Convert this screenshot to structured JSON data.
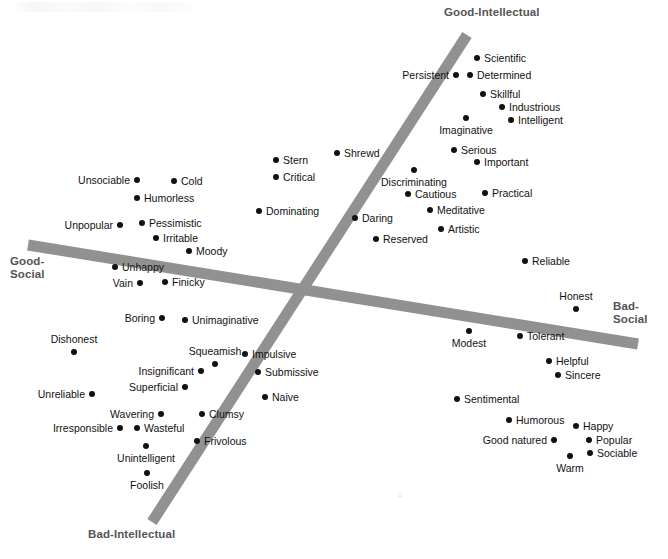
{
  "figure": {
    "background_color": "#ffffff",
    "axis_color": "#919191",
    "point_color": "#111111",
    "label_color": "#111111",
    "axis_label_color": "#555555"
  },
  "axis_labels": {
    "top": "Good-Intellectual",
    "bottom": "Bad-Intellectual",
    "left": "Good-\nSocial",
    "right": "Bad-\nSocial"
  },
  "chart_data": {
    "type": "scatter",
    "xlabel": "Good-Social  ↔  Bad-Social",
    "ylabel": "Good-Intellectual  ↔  Bad-Intellectual",
    "xlim": [
      0,
      668
    ],
    "ylim": [
      0,
      559
    ],
    "grid": false,
    "legend": false,
    "axes": [
      {
        "name": "intellectual-axis",
        "positive_label": "Good-Intellectual",
        "negative_label": "Bad-Intellectual",
        "x1": 467,
        "y1": 35,
        "x2": 152,
        "y2": 522
      },
      {
        "name": "social-axis",
        "positive_label": "Good-Social",
        "negative_label": "Bad-Social",
        "x1": 28,
        "y1": 245,
        "x2": 638,
        "y2": 344
      }
    ],
    "points": [
      {
        "label": "Scientific",
        "x": 477,
        "y": 58,
        "anchor": "right"
      },
      {
        "label": "Persistent",
        "x": 456,
        "y": 75,
        "anchor": "left"
      },
      {
        "label": "Determined",
        "x": 470,
        "y": 75,
        "anchor": "right"
      },
      {
        "label": "Skillful",
        "x": 483,
        "y": 94,
        "anchor": "right"
      },
      {
        "label": "Industrious",
        "x": 502,
        "y": 107,
        "anchor": "right"
      },
      {
        "label": "Intelligent",
        "x": 511,
        "y": 120,
        "anchor": "right"
      },
      {
        "label": "Imaginative",
        "x": 466,
        "y": 118,
        "anchor": "below"
      },
      {
        "label": "Serious",
        "x": 454,
        "y": 150,
        "anchor": "right"
      },
      {
        "label": "Important",
        "x": 477,
        "y": 162,
        "anchor": "right"
      },
      {
        "label": "Discriminating",
        "x": 414,
        "y": 170,
        "anchor": "below"
      },
      {
        "label": "Cautious",
        "x": 408,
        "y": 194,
        "anchor": "right"
      },
      {
        "label": "Practical",
        "x": 485,
        "y": 193,
        "anchor": "right"
      },
      {
        "label": "Meditative",
        "x": 430,
        "y": 210,
        "anchor": "right"
      },
      {
        "label": "Artistic",
        "x": 441,
        "y": 229,
        "anchor": "right"
      },
      {
        "label": "Reserved",
        "x": 376,
        "y": 239,
        "anchor": "right"
      },
      {
        "label": "Daring",
        "x": 355,
        "y": 218,
        "anchor": "right"
      },
      {
        "label": "Shrewd",
        "x": 337,
        "y": 153,
        "anchor": "right"
      },
      {
        "label": "Stern",
        "x": 276,
        "y": 160,
        "anchor": "right"
      },
      {
        "label": "Critical",
        "x": 276,
        "y": 177,
        "anchor": "right"
      },
      {
        "label": "Dominating",
        "x": 259,
        "y": 211,
        "anchor": "right"
      },
      {
        "label": "Unsociable",
        "x": 137,
        "y": 180,
        "anchor": "left"
      },
      {
        "label": "Cold",
        "x": 174,
        "y": 181,
        "anchor": "right"
      },
      {
        "label": "Humorless",
        "x": 137,
        "y": 198,
        "anchor": "right"
      },
      {
        "label": "Unpopular",
        "x": 120,
        "y": 225,
        "anchor": "left"
      },
      {
        "label": "Pessimistic",
        "x": 142,
        "y": 223,
        "anchor": "right"
      },
      {
        "label": "Irritable",
        "x": 156,
        "y": 238,
        "anchor": "right"
      },
      {
        "label": "Moody",
        "x": 189,
        "y": 251,
        "anchor": "right"
      },
      {
        "label": "Unhappy",
        "x": 115,
        "y": 267,
        "anchor": "right"
      },
      {
        "label": "Vain",
        "x": 140,
        "y": 283,
        "anchor": "left"
      },
      {
        "label": "Finicky",
        "x": 165,
        "y": 282,
        "anchor": "right"
      },
      {
        "label": "Reliable",
        "x": 525,
        "y": 261,
        "anchor": "right"
      },
      {
        "label": "Honest",
        "x": 576,
        "y": 309,
        "anchor": "above"
      },
      {
        "label": "Modest",
        "x": 469,
        "y": 331,
        "anchor": "below"
      },
      {
        "label": "Tolerant",
        "x": 520,
        "y": 336,
        "anchor": "right"
      },
      {
        "label": "Helpful",
        "x": 549,
        "y": 361,
        "anchor": "right"
      },
      {
        "label": "Sincere",
        "x": 558,
        "y": 375,
        "anchor": "right"
      },
      {
        "label": "Sentimental",
        "x": 457,
        "y": 399,
        "anchor": "right"
      },
      {
        "label": "Humorous",
        "x": 509,
        "y": 420,
        "anchor": "right"
      },
      {
        "label": "Happy",
        "x": 576,
        "y": 426,
        "anchor": "right"
      },
      {
        "label": "Good natured",
        "x": 554,
        "y": 440,
        "anchor": "left"
      },
      {
        "label": "Popular",
        "x": 589,
        "y": 440,
        "anchor": "right"
      },
      {
        "label": "Sociable",
        "x": 590,
        "y": 453,
        "anchor": "right"
      },
      {
        "label": "Warm",
        "x": 570,
        "y": 456,
        "anchor": "below"
      },
      {
        "label": "Boring",
        "x": 162,
        "y": 318,
        "anchor": "left"
      },
      {
        "label": "Unimaginative",
        "x": 185,
        "y": 320,
        "anchor": "right"
      },
      {
        "label": "Dishonest",
        "x": 74,
        "y": 352,
        "anchor": "above"
      },
      {
        "label": "Squeamish",
        "x": 215,
        "y": 364,
        "anchor": "above"
      },
      {
        "label": "Impulsive",
        "x": 245,
        "y": 354,
        "anchor": "right"
      },
      {
        "label": "Insignificant",
        "x": 201,
        "y": 371,
        "anchor": "left"
      },
      {
        "label": "Submissive",
        "x": 258,
        "y": 372,
        "anchor": "right"
      },
      {
        "label": "Superficial",
        "x": 185,
        "y": 387,
        "anchor": "left"
      },
      {
        "label": "Unreliable",
        "x": 92,
        "y": 394,
        "anchor": "left"
      },
      {
        "label": "Naive",
        "x": 265,
        "y": 397,
        "anchor": "right"
      },
      {
        "label": "Wavering",
        "x": 161,
        "y": 414,
        "anchor": "left"
      },
      {
        "label": "Clumsy",
        "x": 202,
        "y": 414,
        "anchor": "right"
      },
      {
        "label": "Irresponsible",
        "x": 120,
        "y": 428,
        "anchor": "left"
      },
      {
        "label": "Wasteful",
        "x": 137,
        "y": 428,
        "anchor": "right"
      },
      {
        "label": "Frivolous",
        "x": 197,
        "y": 441,
        "anchor": "right"
      },
      {
        "label": "Unintelligent",
        "x": 146,
        "y": 446,
        "anchor": "below"
      },
      {
        "label": "Foolish",
        "x": 147,
        "y": 473,
        "anchor": "below"
      }
    ]
  }
}
